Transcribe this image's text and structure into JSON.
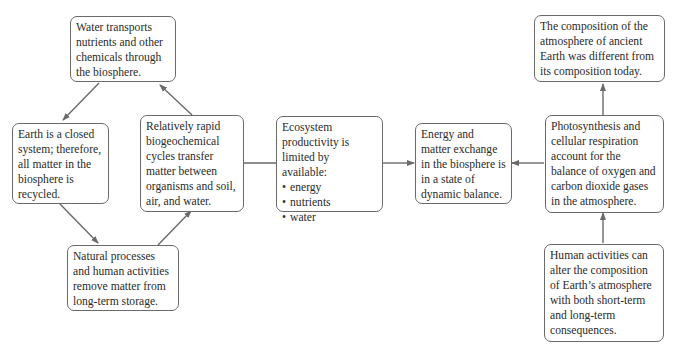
{
  "diagram": {
    "type": "concept-map",
    "nodes": {
      "water_transport": "Water transports nutrients and other chemicals through the biosphere.",
      "closed_system": "Earth is a closed system; therefore, all matter in the biosphere is recycled.",
      "biogeochemical": "Relatively rapid biogeochemical cycles transfer matter between organisms and soil, air, and water.",
      "natural_processes": "Natural processes and human activities remove matter from long-term storage.",
      "ecosystem_intro": "Ecosystem productivity is limited by available:",
      "ecosystem_items": [
        "energy",
        "nutrients",
        "water"
      ],
      "dynamic_balance": "Energy and matter exchange in the biosphere is in a state of dynamic balance.",
      "ancient_atmosphere": "The composition of the atmosphere of ancient Earth was different from its composition today.",
      "photosynthesis": "Photosynthesis and cellular respiration account for the balance of oxygen and carbon dioxide gases in the atmosphere.",
      "human_activities": "Human activities can alter the composition of Earth’s atmosphere with both short-term and long-term consequences."
    },
    "edges": [
      {
        "from": "water_transport",
        "to": "closed_system"
      },
      {
        "from": "closed_system",
        "to": "natural_processes"
      },
      {
        "from": "natural_processes",
        "to": "biogeochemical"
      },
      {
        "from": "biogeochemical",
        "to": "water_transport"
      },
      {
        "from": "ecosystem",
        "to": "dynamic_balance"
      },
      {
        "from": "photosynthesis",
        "to": "dynamic_balance"
      },
      {
        "from": "photosynthesis",
        "to": "ancient_atmosphere"
      },
      {
        "from": "human_activities",
        "to": "photosynthesis"
      }
    ],
    "colors": {
      "line": "#6a6a6a",
      "text": "#2a2a2a"
    }
  }
}
